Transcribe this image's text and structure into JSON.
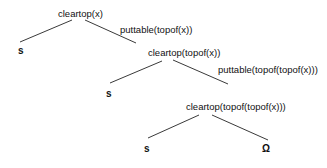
{
  "diagram": {
    "type": "tree",
    "nodes": [
      {
        "id": "n1",
        "label": "cleartop(x)"
      },
      {
        "id": "n1_left",
        "label": "s"
      },
      {
        "id": "n2",
        "label": "cleartop(topof(x))"
      },
      {
        "id": "n2_left",
        "label": "s"
      },
      {
        "id": "n3",
        "label": "cleartop(topof(topof(x)))"
      },
      {
        "id": "n3_left",
        "label": "s"
      },
      {
        "id": "n3_right",
        "label": "Ω"
      }
    ],
    "edges": [
      {
        "from": "n1",
        "to": "n1_left",
        "label": ""
      },
      {
        "from": "n1",
        "to": "n2",
        "label": "puttable(topof(x))"
      },
      {
        "from": "n2",
        "to": "n2_left",
        "label": ""
      },
      {
        "from": "n2",
        "to": "n3",
        "label": "puttable(topof(topof(x)))"
      },
      {
        "from": "n3",
        "to": "n3_left",
        "label": ""
      },
      {
        "from": "n3",
        "to": "n3_right",
        "label": ""
      }
    ]
  }
}
